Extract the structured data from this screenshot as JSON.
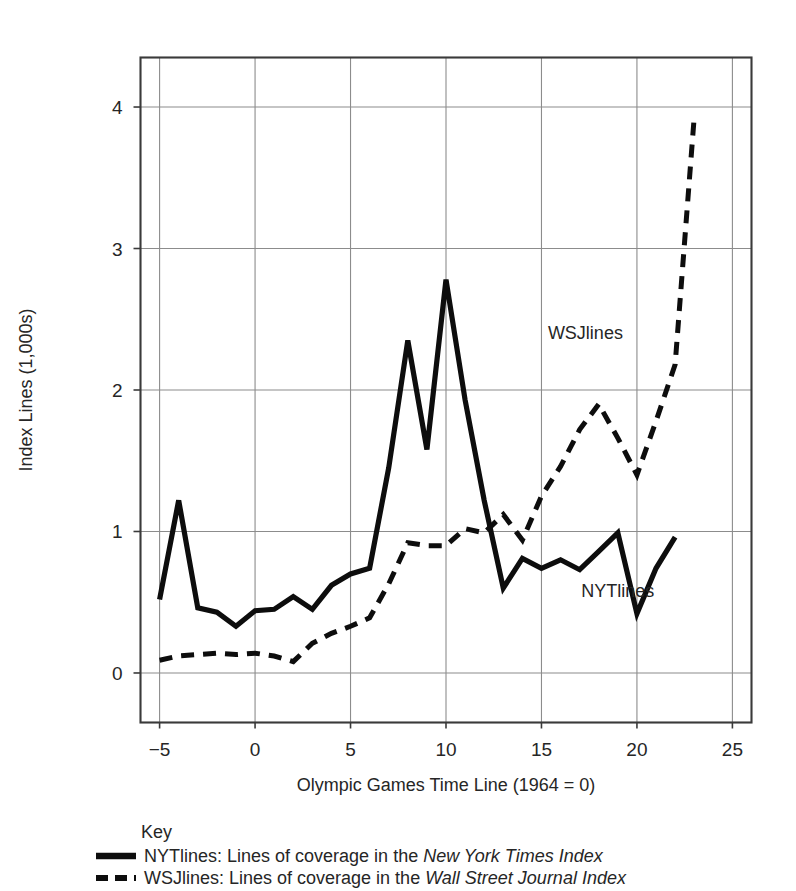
{
  "chart_data": {
    "type": "line",
    "title": "",
    "xlabel": "Olympic Games Time Line (1964 = 0)",
    "ylabel": "Index Lines (1,000s)",
    "xlim": [
      -6,
      26
    ],
    "ylim": [
      -0.35,
      4.35
    ],
    "xticks": [
      -5,
      0,
      5,
      10,
      15,
      20,
      25
    ],
    "xticklabels": [
      "−5",
      "0",
      "5",
      "10",
      "15",
      "20",
      "25"
    ],
    "yticks": [
      0,
      1,
      2,
      3,
      4
    ],
    "yticklabels": [
      "0",
      "1",
      "2",
      "3",
      "4"
    ],
    "grid": true,
    "legend_position": "below-axes",
    "series": [
      {
        "name": "NYTlines",
        "style": "solid",
        "annotation": "NYTlines",
        "annotation_x": 19.0,
        "annotation_y": 0.54,
        "x": [
          -5,
          -4,
          -3,
          -2,
          -1,
          0,
          1,
          2,
          3,
          4,
          5,
          6,
          7,
          8,
          9,
          10,
          11,
          12,
          13,
          14,
          15,
          16,
          17,
          18,
          19,
          20,
          21,
          22
        ],
        "y": [
          0.52,
          1.22,
          0.46,
          0.43,
          0.33,
          0.44,
          0.45,
          0.54,
          0.45,
          0.62,
          0.7,
          0.74,
          1.45,
          2.35,
          1.58,
          2.78,
          1.93,
          1.22,
          0.6,
          0.81,
          0.74,
          0.8,
          0.73,
          0.86,
          0.99,
          0.42,
          0.74,
          0.96
        ]
      },
      {
        "name": "WSJlines",
        "style": "dashed",
        "annotation": "WSJlines",
        "annotation_x": 17.3,
        "annotation_y": 2.36,
        "x": [
          -5,
          -4,
          -3,
          -2,
          -1,
          0,
          1,
          2,
          3,
          4,
          5,
          6,
          7,
          8,
          9,
          10,
          11,
          12,
          13,
          14,
          15,
          16,
          17,
          18,
          19,
          20,
          21,
          22,
          23
        ],
        "y": [
          0.09,
          0.12,
          0.13,
          0.14,
          0.13,
          0.14,
          0.12,
          0.08,
          0.21,
          0.28,
          0.33,
          0.39,
          0.63,
          0.92,
          0.9,
          0.9,
          1.02,
          0.99,
          1.12,
          0.94,
          1.25,
          1.46,
          1.72,
          1.9,
          1.66,
          1.4,
          1.78,
          2.18,
          3.93
        ]
      }
    ]
  },
  "key": {
    "title": "Key",
    "entries": [
      {
        "style": "solid",
        "prefix": "NYTlines: Lines of coverage in the ",
        "emphasis": "New York Times Index"
      },
      {
        "style": "dashed",
        "prefix": "WSJlines: Lines of coverage in the ",
        "emphasis": "Wall Street Journal Index"
      }
    ]
  }
}
